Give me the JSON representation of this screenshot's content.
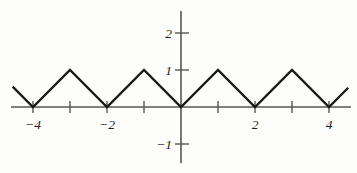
{
  "chart_data": {
    "type": "line",
    "title": "",
    "subtitle": "",
    "xlabel": "",
    "ylabel": "",
    "xlim": [
      -4.55,
      4.55
    ],
    "ylim": [
      -1.6,
      2.35
    ],
    "grid": false,
    "legend": null,
    "x_ticks": [
      -4,
      -3,
      -2,
      -1,
      0,
      1,
      2,
      3,
      4
    ],
    "x_tick_labels": [
      "−4",
      "",
      "−2",
      "",
      "",
      "",
      "2",
      "",
      "4"
    ],
    "y_ticks": [
      -1,
      1,
      2
    ],
    "y_tick_labels": [
      "−1",
      "1",
      "2"
    ],
    "series": [
      {
        "name": "triangular wave",
        "color": "#1a1a1a",
        "x": [
          -4.55,
          -4,
          -3,
          -2,
          -1,
          0,
          1,
          2,
          3,
          4,
          4.52
        ],
        "y": [
          0.55,
          0,
          1,
          0,
          1,
          0,
          1,
          0,
          1,
          0,
          0.52
        ]
      }
    ],
    "points": [
      {
        "x": -4.55,
        "y": 0.55
      },
      {
        "x": -4,
        "y": 0
      },
      {
        "x": -3,
        "y": 1
      },
      {
        "x": -2,
        "y": 0
      },
      {
        "x": -1,
        "y": 1
      },
      {
        "x": 0,
        "y": 0
      },
      {
        "x": 1,
        "y": 1
      },
      {
        "x": 2,
        "y": 0
      },
      {
        "x": 3,
        "y": 1
      },
      {
        "x": 4,
        "y": 0
      },
      {
        "x": 4.52,
        "y": 0.52
      }
    ]
  },
  "labels": {
    "x_neg4": "−4",
    "x_neg2": "−2",
    "x_pos2": "2",
    "x_pos4": "4",
    "y_neg1": "−1",
    "y_pos1": "1",
    "y_pos2": "2"
  },
  "colors": {
    "curve": "#1a1a1a",
    "axis": "#565656",
    "background": "#fdfdfc",
    "text": "#1d1d1d"
  }
}
